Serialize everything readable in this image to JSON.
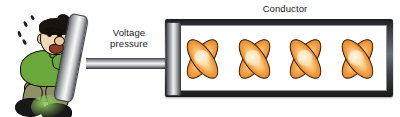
{
  "diagram": {
    "labels": {
      "voltage_pressure": "Voltage\npressure",
      "conductor": "Conductor"
    },
    "colors": {
      "electron_orange": "#f4a64a",
      "electron_highlight": "#fdf0d8",
      "electron_outline": "#2a1a08",
      "shirt_green": "#6aa83c",
      "pants_olive": "#8e9068",
      "shoe_black": "#18181a",
      "strap_orange": "#f0962c",
      "skin": "#f2d9b6",
      "hair_black": "#1a1410",
      "metal_gray": "#8e9095",
      "conductor_frame": "#45474a",
      "conductor_interior": "#ffffff",
      "text": "#1b1b1b",
      "background": "#ffffff"
    },
    "figure": {
      "name": "man-pushing",
      "description": "Cartoon man straining to push a plate",
      "sweat_drop_count": 4
    },
    "piston": {
      "plate_name": "piston-plate",
      "rod_name": "push-rod",
      "head_name": "piston-head"
    },
    "conductor": {
      "electron_count": 4,
      "electrons": [
        {
          "name": "electron-1"
        },
        {
          "name": "electron-2"
        },
        {
          "name": "electron-3"
        },
        {
          "name": "electron-4"
        }
      ]
    }
  }
}
